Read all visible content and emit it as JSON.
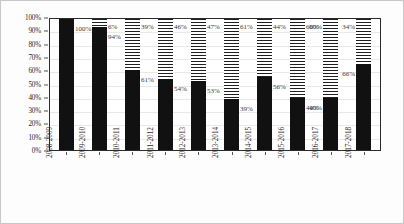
{
  "chart_data": {
    "type": "bar",
    "variant": "stacked-100-percent",
    "title": "",
    "xlabel": "",
    "ylabel": "",
    "ylim": [
      0,
      100
    ],
    "ytick_labels": [
      "0%",
      "10%",
      "20%",
      "30%",
      "40%",
      "50%",
      "60%",
      "70%",
      "80%",
      "90%",
      "100%"
    ],
    "ytick_values": [
      0,
      10,
      20,
      30,
      40,
      50,
      60,
      70,
      80,
      90,
      100
    ],
    "grid": true,
    "legend": "none",
    "categories": [
      "2008-2009",
      "2009-2010",
      "2010-2011",
      "2011-2012",
      "2012-2013",
      "2013-2014",
      "2014-2015",
      "2015-2016",
      "2016-2017",
      "2017-2018"
    ],
    "series": [
      {
        "name": "solid-black-segment",
        "fill": "solid",
        "color": "#111111",
        "values": [
          100,
          94,
          61,
          54,
          53,
          39,
          56,
          40,
          40,
          66
        ],
        "labels": [
          "100%",
          "94%",
          "61%",
          "54%",
          "53%",
          "39%",
          "56%",
          "40%",
          "40%",
          "66%"
        ]
      },
      {
        "name": "hatched-segment",
        "fill": "horizontal-hatch",
        "color": "#1f1f1f",
        "values": [
          0,
          6,
          39,
          46,
          47,
          61,
          44,
          60,
          60,
          34
        ],
        "labels": [
          "",
          "6%",
          "39%",
          "46%",
          "47%",
          "61%",
          "44%",
          "60%",
          "60%",
          "34%"
        ]
      }
    ]
  }
}
